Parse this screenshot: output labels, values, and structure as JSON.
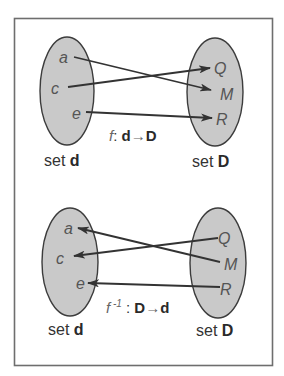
{
  "diagrams": [
    {
      "id": "forward",
      "domain_set": {
        "label_prefix": "set ",
        "label_name": "d",
        "elements": [
          "a",
          "c",
          "e"
        ]
      },
      "codomain_set": {
        "label_prefix": "set ",
        "label_name": "D",
        "elements": [
          "Q",
          "M",
          "R"
        ]
      },
      "function_label": {
        "name": "f",
        "superscript": "",
        "separator": ": ",
        "from": "d",
        "arrow": "→",
        "to": "D"
      },
      "mappings": [
        {
          "from": "a",
          "to": "M"
        },
        {
          "from": "c",
          "to": "Q"
        },
        {
          "from": "e",
          "to": "R"
        }
      ]
    },
    {
      "id": "inverse",
      "domain_set": {
        "label_prefix": "set ",
        "label_name": "d",
        "elements": [
          "a",
          "c",
          "e"
        ]
      },
      "codomain_set": {
        "label_prefix": "set ",
        "label_name": "D",
        "elements": [
          "Q",
          "M",
          "R"
        ]
      },
      "function_label": {
        "name": "f",
        "superscript": " -1",
        "separator": " : ",
        "from": "D",
        "arrow": "→",
        "to": "d"
      },
      "mappings": [
        {
          "from": "M",
          "to": "a"
        },
        {
          "from": "Q",
          "to": "c"
        },
        {
          "from": "R",
          "to": "e"
        }
      ]
    }
  ],
  "colors": {
    "set_fill": "#c9c9c9",
    "set_stroke": "#3c3c3c",
    "arrow": "#333333",
    "element_text": "#555555",
    "frame": "#6e6e6e"
  }
}
